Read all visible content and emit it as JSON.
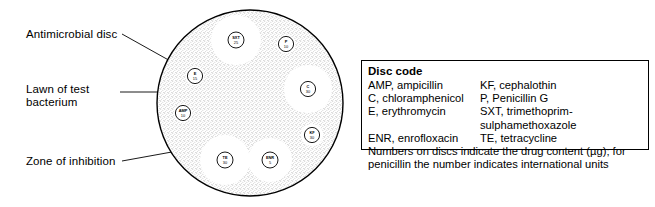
{
  "callouts": {
    "antimicrobial_disc": "Antimicrobial disc",
    "lawn": "Lawn of test\nbacterium",
    "zone": "Zone of inhibition"
  },
  "plate": {
    "discs": [
      {
        "code": "SXT",
        "value": "25",
        "cx": 236,
        "cy": 40,
        "r": 8.0,
        "zone_r": 25
      },
      {
        "code": "P",
        "value": "10",
        "cx": 286,
        "cy": 44,
        "r": 7.6,
        "zone_r": 9.5
      },
      {
        "code": "C",
        "value": "30",
        "cx": 308,
        "cy": 89,
        "r": 7.6,
        "zone_r": 24
      },
      {
        "code": "E",
        "value": "15",
        "cx": 195,
        "cy": 76,
        "r": 7.6,
        "zone_r": 9.5
      },
      {
        "code": "AMP",
        "value": "10",
        "cx": 183,
        "cy": 113,
        "r": 7.6,
        "zone_r": 9.5
      },
      {
        "code": "KF",
        "value": "30",
        "cx": 312,
        "cy": 135,
        "r": 7.6,
        "zone_r": 11
      },
      {
        "code": "TE",
        "value": "30",
        "cx": 225,
        "cy": 160,
        "r": 8.0,
        "zone_r": 25
      },
      {
        "code": "ENR",
        "value": "5",
        "cx": 270,
        "cy": 160,
        "r": 8.0,
        "zone_r": 22
      }
    ]
  },
  "legend": {
    "title": "Disc code",
    "rows": [
      {
        "left": "AMP, ampicillin",
        "right": "KF, cephalothin"
      },
      {
        "left": "C, chloramphenicol",
        "right": "P, Penicillin G"
      },
      {
        "left": "E, erythromycin",
        "right": "SXT, trimethoprim-sulphamethoxazole"
      },
      {
        "left": "ENR, enrofloxacin",
        "right": "TE, tetracycline"
      }
    ],
    "note": "Numbers on discs indicate the drug content (µg); for penicillin the number indicates international units"
  },
  "colors": {
    "ink": "#000000",
    "background": "#ffffff",
    "lawn": "#8d8d8d"
  }
}
